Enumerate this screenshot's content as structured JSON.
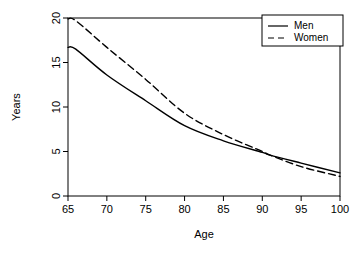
{
  "chart_data": {
    "type": "line",
    "title": "",
    "xlabel": "Age",
    "ylabel": "Years",
    "xlim": [
      65,
      100
    ],
    "ylim": [
      0,
      20
    ],
    "xticks": [
      65,
      70,
      75,
      80,
      85,
      90,
      95,
      100
    ],
    "yticks": [
      0,
      5,
      10,
      15,
      20
    ],
    "grid": false,
    "legend_position": "top-right",
    "x": [
      65,
      66,
      70,
      75,
      80,
      85,
      90,
      91,
      95,
      100
    ],
    "series": [
      {
        "name": "Men",
        "style": "solid",
        "color": "#000000",
        "values": [
          16.7,
          16.5,
          13.6,
          10.7,
          7.9,
          6.2,
          4.9,
          4.6,
          3.7,
          2.6
        ]
      },
      {
        "name": "Women",
        "style": "dashed",
        "color": "#000000",
        "values": [
          19.9,
          19.7,
          16.7,
          13.1,
          9.3,
          6.9,
          5.0,
          4.6,
          3.3,
          2.2
        ]
      }
    ],
    "annotations": []
  },
  "legend": {
    "entries": [
      {
        "label": "Men",
        "style": "solid"
      },
      {
        "label": "Women",
        "style": "dashed"
      }
    ]
  },
  "axes": {
    "x_title": "Age",
    "y_title": "Years",
    "x_tick_labels": [
      "65",
      "70",
      "75",
      "80",
      "85",
      "90",
      "95",
      "100"
    ],
    "y_tick_labels": [
      "0",
      "5",
      "10",
      "15",
      "20"
    ]
  },
  "colors": {
    "background": "#ffffff",
    "axis": "#000000",
    "line": "#000000"
  }
}
